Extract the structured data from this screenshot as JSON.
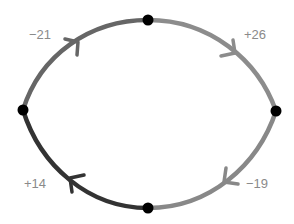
{
  "diagram": {
    "type": "cycle",
    "direction": "clockwise",
    "nodes": [
      {
        "id": "top",
        "x": 148,
        "y": 20
      },
      {
        "id": "right",
        "x": 276,
        "y": 111
      },
      {
        "id": "bottom",
        "x": 148,
        "y": 208
      },
      {
        "id": "left",
        "x": 23,
        "y": 110
      }
    ],
    "edges": [
      {
        "id": "left-to-top",
        "from": "left",
        "to": "top",
        "label": "−21",
        "color": "#666666",
        "label_x": 30,
        "label_y": 27
      },
      {
        "id": "top-to-right",
        "from": "top",
        "to": "right",
        "label": "+26",
        "color": "#8c8c8c",
        "label_x": 244,
        "label_y": 27
      },
      {
        "id": "right-to-bottom",
        "from": "right",
        "to": "bottom",
        "label": "−19",
        "color": "#888888",
        "label_x": 246,
        "label_y": 176
      },
      {
        "id": "bottom-to-left",
        "from": "bottom",
        "to": "left",
        "label": "+14",
        "color": "#333333",
        "label_x": 23,
        "label_y": 176
      }
    ],
    "node_color": "#000000",
    "label_color": "#8a8a8a"
  }
}
